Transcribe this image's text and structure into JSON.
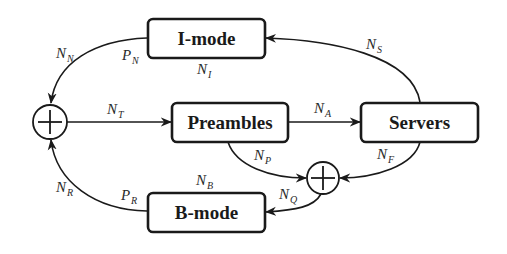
{
  "nodes": {
    "imode": {
      "label": "I-mode"
    },
    "preambles": {
      "label": "Preambles"
    },
    "servers": {
      "label": "Servers"
    },
    "bmode": {
      "label": "B-mode"
    },
    "sum_left": {
      "symbol": "plus-circle"
    },
    "sum_right": {
      "symbol": "plus-circle"
    }
  },
  "edges": [
    {
      "from": "imode",
      "to": "sum_left",
      "label": "N",
      "sub": "N",
      "port_label": "P",
      "port_sub": "N"
    },
    {
      "from": "sum_left",
      "to": "preambles",
      "label": "N",
      "sub": "T"
    },
    {
      "from": "preambles",
      "to": "servers",
      "label": "N",
      "sub": "A"
    },
    {
      "from": "servers",
      "to": "imode",
      "label": "N",
      "sub": "S"
    },
    {
      "from": "preambles",
      "to": "sum_right",
      "label": "N",
      "sub": "P"
    },
    {
      "from": "servers",
      "to": "sum_right",
      "label": "N",
      "sub": "F"
    },
    {
      "from": "sum_right",
      "to": "bmode",
      "label": "N",
      "sub": "Q"
    },
    {
      "from": "bmode",
      "to": "sum_left",
      "label": "N",
      "sub": "R",
      "port_label": "P",
      "port_sub": "R"
    }
  ],
  "annotations": {
    "imode_count": {
      "label": "N",
      "sub": "I"
    },
    "bmode_count": {
      "label": "N",
      "sub": "B"
    }
  },
  "colors": {
    "stroke": "#1a1a1a",
    "background": "#ffffff"
  }
}
